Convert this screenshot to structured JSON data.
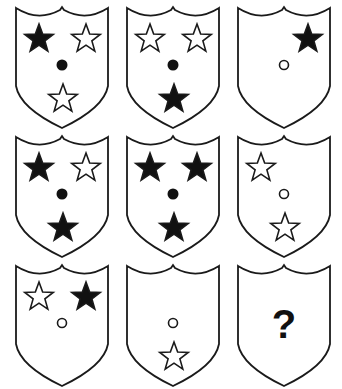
{
  "puzzle": {
    "type": "3x3 matrix reasoning",
    "colors": {
      "outline": "#1a1a1a",
      "filled": "#111111",
      "background": "#ffffff"
    },
    "cells": [
      {
        "row": 0,
        "col": 0,
        "x": 14,
        "y": 4,
        "items": [
          {
            "shape": "star",
            "fill": "black",
            "pos": "top-left"
          },
          {
            "shape": "star",
            "fill": "white",
            "pos": "top-right"
          },
          {
            "shape": "dot",
            "fill": "black",
            "pos": "center"
          },
          {
            "shape": "star",
            "fill": "white",
            "pos": "bottom"
          }
        ]
      },
      {
        "row": 0,
        "col": 1,
        "x": 125,
        "y": 4,
        "items": [
          {
            "shape": "star",
            "fill": "white",
            "pos": "top-left"
          },
          {
            "shape": "star",
            "fill": "white",
            "pos": "top-right"
          },
          {
            "shape": "dot",
            "fill": "black",
            "pos": "center"
          },
          {
            "shape": "star",
            "fill": "black",
            "pos": "bottom"
          }
        ]
      },
      {
        "row": 0,
        "col": 2,
        "x": 236,
        "y": 4,
        "items": [
          {
            "shape": "star",
            "fill": "black",
            "pos": "top-right"
          },
          {
            "shape": "dot",
            "fill": "white",
            "pos": "center"
          }
        ]
      },
      {
        "row": 1,
        "col": 0,
        "x": 14,
        "y": 133,
        "items": [
          {
            "shape": "star",
            "fill": "black",
            "pos": "top-left"
          },
          {
            "shape": "star",
            "fill": "white",
            "pos": "top-right"
          },
          {
            "shape": "dot",
            "fill": "black",
            "pos": "center"
          },
          {
            "shape": "star",
            "fill": "black",
            "pos": "bottom"
          }
        ]
      },
      {
        "row": 1,
        "col": 1,
        "x": 125,
        "y": 133,
        "items": [
          {
            "shape": "star",
            "fill": "black",
            "pos": "top-left"
          },
          {
            "shape": "star",
            "fill": "black",
            "pos": "top-right"
          },
          {
            "shape": "dot",
            "fill": "black",
            "pos": "center"
          },
          {
            "shape": "star",
            "fill": "black",
            "pos": "bottom"
          }
        ]
      },
      {
        "row": 1,
        "col": 2,
        "x": 236,
        "y": 133,
        "items": [
          {
            "shape": "star",
            "fill": "white",
            "pos": "top-left"
          },
          {
            "shape": "dot",
            "fill": "white",
            "pos": "center"
          },
          {
            "shape": "star",
            "fill": "white",
            "pos": "bottom"
          }
        ]
      },
      {
        "row": 2,
        "col": 0,
        "x": 14,
        "y": 262,
        "items": [
          {
            "shape": "star",
            "fill": "white",
            "pos": "top-left"
          },
          {
            "shape": "star",
            "fill": "black",
            "pos": "top-right"
          },
          {
            "shape": "dot",
            "fill": "white",
            "pos": "center"
          }
        ]
      },
      {
        "row": 2,
        "col": 1,
        "x": 125,
        "y": 262,
        "items": [
          {
            "shape": "dot",
            "fill": "white",
            "pos": "center"
          },
          {
            "shape": "star",
            "fill": "white",
            "pos": "bottom"
          }
        ]
      },
      {
        "row": 2,
        "col": 2,
        "x": 236,
        "y": 262,
        "items": [
          {
            "shape": "question",
            "label": "?"
          }
        ]
      }
    ]
  }
}
